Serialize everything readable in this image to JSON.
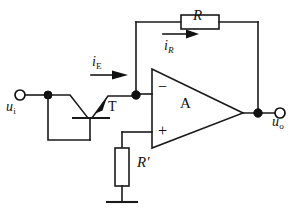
{
  "figure": {
    "kind": "circuit-diagram",
    "background_color": "#ffffff",
    "line_color": "#1a1a1a"
  },
  "labels": {
    "input_terminal": "u",
    "input_terminal_sub": "i",
    "output_terminal": "u",
    "output_terminal_sub": "o",
    "emitter_current": "i",
    "emitter_current_sub": "E",
    "feedback_current": "i",
    "feedback_current_sub": "R",
    "feedback_resistor": "R",
    "balance_resistor": "R′",
    "transistor": "T",
    "opamp": "A",
    "inverting_input": "−",
    "noninverting_input": "+"
  },
  "components": [
    {
      "name": "input-terminal",
      "type": "open-terminal",
      "label": "u i"
    },
    {
      "name": "transistor-T",
      "type": "bjt-transistor",
      "label": "T"
    },
    {
      "name": "opamp-A",
      "type": "operational-amplifier",
      "label": "A",
      "inputs": [
        "−",
        "+"
      ]
    },
    {
      "name": "feedback-resistor-R",
      "type": "resistor",
      "label": "R",
      "orientation": "horizontal"
    },
    {
      "name": "balance-resistor-Rprime",
      "type": "resistor",
      "label": "R′",
      "orientation": "vertical"
    },
    {
      "name": "ground",
      "type": "ground-symbol",
      "label": ""
    },
    {
      "name": "output-terminal",
      "type": "open-terminal",
      "label": "u o"
    }
  ],
  "currents": [
    {
      "name": "emitter-current",
      "label": "i E",
      "direction": "right"
    },
    {
      "name": "feedback-current",
      "label": "i R",
      "direction": "right"
    }
  ]
}
